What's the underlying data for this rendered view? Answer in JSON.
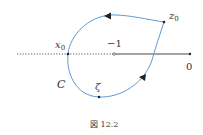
{
  "figure": {
    "caption": "図 12.2",
    "colors": {
      "contour": "#5b9bd5",
      "axis": "#333333",
      "text": "#333333"
    },
    "labels": {
      "x0": "x",
      "x0_sub": "0",
      "minus_one": "−1",
      "zero": "0",
      "z0": "z",
      "z0_sub": "0",
      "zeta": "ζ",
      "contour": "C"
    },
    "points": {
      "x0": [
        68,
        54
      ],
      "minus_one": [
        114,
        54
      ],
      "zero": [
        190,
        54
      ],
      "z0": [
        164,
        22
      ],
      "zeta": [
        99,
        97
      ]
    },
    "axis": {
      "dotted_from": 17,
      "dotted_to": 114,
      "solid_from": 114,
      "solid_to": 190,
      "y": 54
    }
  }
}
